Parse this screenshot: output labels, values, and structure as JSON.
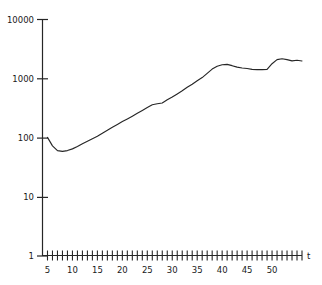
{
  "chart_data": {
    "type": "line",
    "title": "",
    "subtitle": "",
    "xlabel": "t",
    "ylabel": "",
    "yscale": "log",
    "xscale": "linear",
    "grid": false,
    "legend": null,
    "legend_position": "none",
    "xlim": [
      4,
      56
    ],
    "ylim": [
      1,
      10000
    ],
    "xticks_labeled": [
      5,
      10,
      15,
      20,
      25,
      30,
      35,
      40,
      45,
      50
    ],
    "xtick_labels": [
      "5",
      "10",
      "15",
      "20",
      "25",
      "30",
      "35",
      "40",
      "45",
      "50"
    ],
    "xticks_minor_every": 1,
    "xtick_minor_range": [
      5,
      56
    ],
    "yticks": [
      1,
      10,
      100,
      1000,
      10000
    ],
    "ytick_labels": [
      "1",
      "10",
      "100",
      "1000",
      "10000"
    ],
    "line_color": "#262626",
    "line_width": 1,
    "series": [
      {
        "name": "series-1",
        "x": [
          5,
          6,
          7,
          8,
          9,
          10,
          11,
          12,
          13,
          14,
          15,
          16,
          17,
          18,
          19,
          20,
          21,
          22,
          23,
          24,
          25,
          26,
          27,
          28,
          29,
          30,
          31,
          32,
          33,
          34,
          35,
          36,
          37,
          38,
          39,
          40,
          41,
          42,
          43,
          44,
          45,
          46,
          47,
          48,
          49,
          50,
          51,
          52,
          53,
          54,
          55,
          56
        ],
        "y": [
          100,
          72,
          60,
          58,
          60,
          64,
          70,
          78,
          86,
          95,
          105,
          118,
          132,
          148,
          165,
          185,
          205,
          228,
          255,
          285,
          320,
          355,
          370,
          380,
          430,
          480,
          540,
          610,
          700,
          790,
          900,
          1020,
          1200,
          1420,
          1580,
          1680,
          1700,
          1620,
          1530,
          1480,
          1450,
          1400,
          1390,
          1390,
          1400,
          1750,
          2050,
          2120,
          2050,
          1950,
          2000,
          1940
        ]
      }
    ]
  },
  "axes": {
    "x_axis_label": "t",
    "y_axis_label": ""
  }
}
